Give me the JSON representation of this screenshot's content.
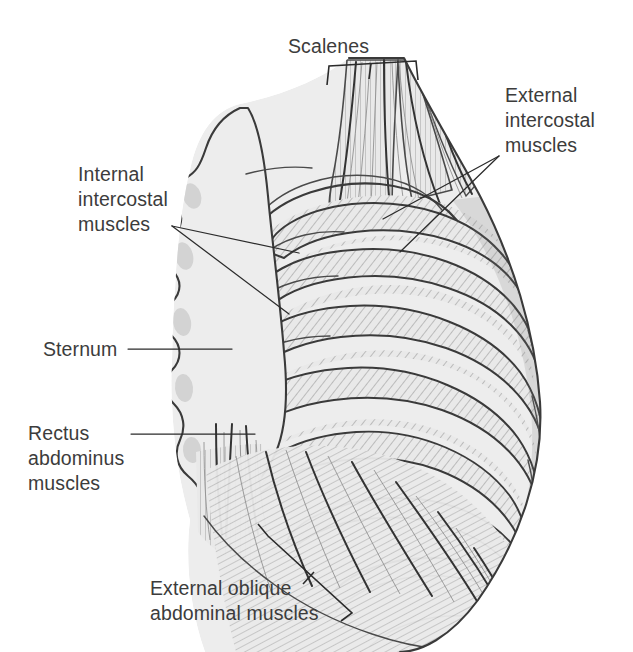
{
  "figure": {
    "type": "anatomical-illustration",
    "background_color": "#ffffff",
    "line_color": "#3a3a3a",
    "fill_color": "#ececec",
    "hatch_color": "#8d8d8d",
    "text_color": "#3c3c3c"
  },
  "labels": {
    "scalenes": {
      "lines": [
        "Scalenes"
      ],
      "text": "Scalenes",
      "anchor": "bracket-top",
      "position": {
        "x": 288,
        "y": 53
      }
    },
    "external_intercostal": {
      "lines": [
        "External",
        "intercostal",
        "muscles"
      ],
      "text": "External intercostal muscles",
      "anchor": "two-leader-lines-right",
      "position": {
        "x": 505,
        "y": 102
      }
    },
    "internal_intercostal": {
      "lines": [
        "Internal",
        "intercostal",
        "muscles"
      ],
      "text": "Internal intercostal muscles",
      "anchor": "two-leader-lines-left",
      "position": {
        "x": 78,
        "y": 181
      }
    },
    "sternum": {
      "lines": [
        "Sternum"
      ],
      "text": "Sternum",
      "anchor": "single-leader-line",
      "position": {
        "x": 43,
        "y": 355
      }
    },
    "rectus_abdominus": {
      "lines": [
        "Rectus",
        "abdominus",
        "muscles"
      ],
      "text": "Rectus abdominus muscles",
      "anchor": "single-leader-line",
      "position": {
        "x": 28,
        "y": 439
      }
    },
    "external_oblique": {
      "lines": [
        "External oblique",
        "abdominal muscles"
      ],
      "text": "External oblique abdominal muscles",
      "anchor": "angled-bracket",
      "position": {
        "x": 150,
        "y": 595
      }
    }
  },
  "structures": [
    {
      "name": "scalenes",
      "description": "vertical striated muscle bands at superior thorax"
    },
    {
      "name": "sternum",
      "description": "scalloped flat bone at anterior midline, left of figure"
    },
    {
      "name": "ribs",
      "description": "curved costal arches sweeping from sternum to posterior, 10 visible"
    },
    {
      "name": "external-intercostal-muscles",
      "description": "hatched muscle between ribs, lateral aspect"
    },
    {
      "name": "internal-intercostal-muscles",
      "description": "hatched muscle between ribs, near sternum"
    },
    {
      "name": "rectus-abdominus-muscles",
      "description": "vertical striated bands inferior to sternum"
    },
    {
      "name": "external-oblique-abdominal-muscles",
      "description": "diagonal striated fibers over lower lateral trunk"
    }
  ]
}
